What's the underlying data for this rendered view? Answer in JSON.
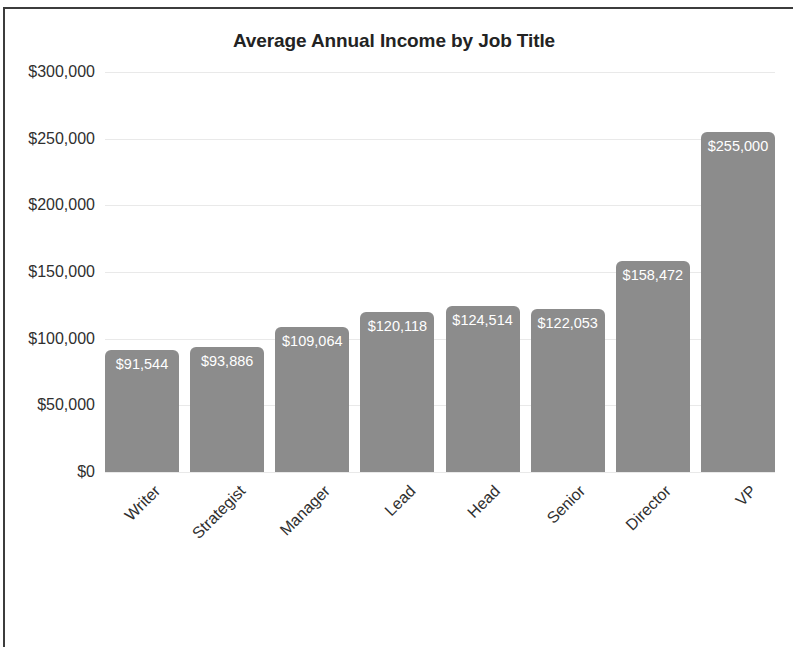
{
  "chart_data": {
    "type": "bar",
    "title": "Average Annual Income by Job Title",
    "xlabel": "",
    "ylabel": "",
    "categories": [
      "Writer",
      "Strategist",
      "Manager",
      "Lead",
      "Head",
      "Senior",
      "Director",
      "VP"
    ],
    "values": [
      91544,
      93886,
      109064,
      120118,
      124514,
      122053,
      158472,
      255000
    ],
    "value_labels": [
      "$91,544",
      "$93,886",
      "$109,064",
      "$120,118",
      "$124,514",
      "$122,053",
      "$158,472",
      "$255,000"
    ],
    "ylim": [
      0,
      300000
    ],
    "ytick_values": [
      0,
      50000,
      100000,
      150000,
      200000,
      250000,
      300000
    ],
    "ytick_labels": [
      "$0",
      "$50,000",
      "$100,000",
      "$150,000",
      "$200,000",
      "$250,000",
      "$300,000"
    ],
    "grid": true,
    "legend": false,
    "bar_color": "#8c8c8c",
    "value_label_color": "#ffffff",
    "gridline_color": "#e9e9e9",
    "title_color": "#232323",
    "axis_label_color": "#2f2f2f",
    "background_color": "#ffffff",
    "xtick_rotation_degrees": -45
  }
}
